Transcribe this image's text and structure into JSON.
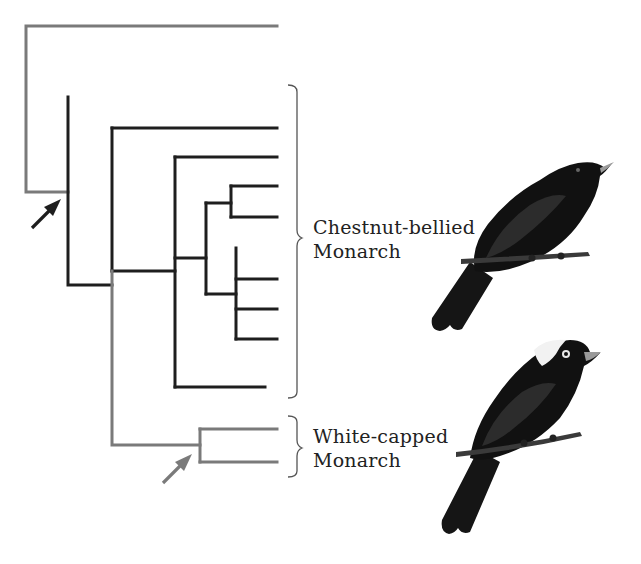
{
  "colors": {
    "black_branch": "#1e1e1e",
    "grey_branch": "#7a7a7a",
    "bracket": "#555555",
    "text": "#222222"
  },
  "clades": [
    {
      "id": "chestnut",
      "label_line1": "Chestnut-bellied",
      "label_line2": "Monarch",
      "tips": 9
    },
    {
      "id": "whitecapped",
      "label_line1": "White-capped",
      "label_line2": "Monarch",
      "tips": 2
    }
  ],
  "arrows": [
    {
      "id": "arrow-root-node",
      "color": "black",
      "points_to": "black clade node"
    },
    {
      "id": "arrow-whitecapped-node",
      "color": "grey",
      "points_to": "white-capped clade node"
    }
  ],
  "birds": [
    {
      "id": "chestnut-bellied-bird",
      "description": "all-black monarch perched on branch"
    },
    {
      "id": "white-capped-bird",
      "description": "black monarch with white cap perched on branch"
    }
  ]
}
